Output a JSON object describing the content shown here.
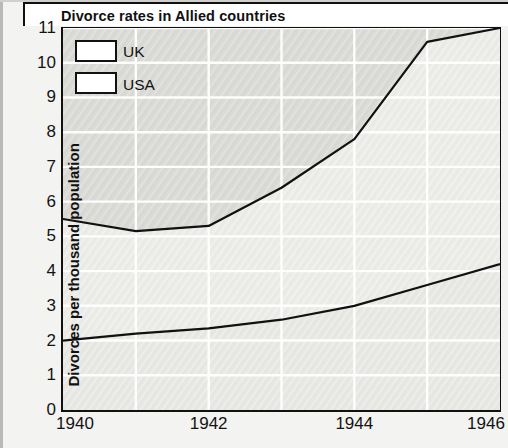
{
  "chart": {
    "title": "Divorce rates in Allied countries",
    "ylabel": "Divorces per thousand population"
  },
  "legend": {
    "items": [
      {
        "label": "UK"
      },
      {
        "label": "USA"
      }
    ]
  },
  "axes": {
    "y_ticks": [
      "11",
      "10",
      "9",
      "8",
      "7",
      "6",
      "5",
      "4",
      "3",
      "2",
      "1",
      "0"
    ],
    "x_ticks": [
      "1940",
      "1942",
      "1944",
      "1946"
    ]
  },
  "chart_data": {
    "type": "area",
    "title": "Divorce rates in Allied countries",
    "xlabel": "",
    "ylabel": "Divorces per thousand population",
    "x": [
      1940,
      1941,
      1942,
      1943,
      1944,
      1945,
      1946
    ],
    "x_tick_labels": [
      "1940",
      "1942",
      "1944",
      "1946"
    ],
    "x_tick_values": [
      1940,
      1942,
      1944,
      1946
    ],
    "xlim": [
      1940,
      1946
    ],
    "ylim": [
      0,
      11
    ],
    "y_tick_values": [
      0,
      1,
      2,
      3,
      4,
      5,
      6,
      7,
      8,
      9,
      10,
      11
    ],
    "grid": true,
    "legend_position": "top-left",
    "series": [
      {
        "name": "UK",
        "values": [
          5.5,
          5.15,
          5.3,
          6.4,
          7.8,
          10.6,
          11.0
        ]
      },
      {
        "name": "USA",
        "values": [
          2.0,
          2.2,
          2.35,
          2.6,
          3.0,
          3.6,
          4.2
        ]
      }
    ]
  },
  "colors": {
    "line": "#111111",
    "uk_band": "#d8d8d4",
    "usa_band": "#e6e6e2",
    "plot_background": "#ffffff",
    "page_background": "#f3f3f1"
  }
}
